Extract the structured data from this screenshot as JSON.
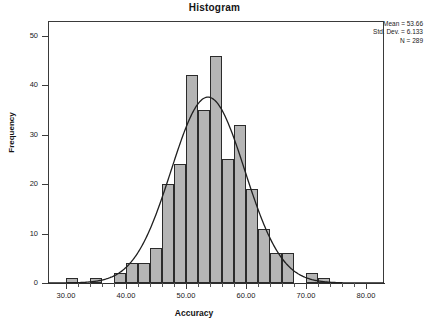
{
  "chart_data": {
    "type": "bar",
    "title": "Histogram",
    "xlabel": "Accuracy",
    "ylabel": "Frequency",
    "xlim": [
      27,
      83
    ],
    "ylim": [
      0,
      53
    ],
    "grid": false,
    "legend": "none",
    "bin_width": 2,
    "bin_starts": [
      30,
      32,
      34,
      36,
      38,
      40,
      42,
      44,
      46,
      48,
      50,
      52,
      54,
      56,
      58,
      60,
      62,
      64,
      66,
      68,
      70,
      72
    ],
    "categories": [
      "30-32",
      "32-34",
      "34-36",
      "36-38",
      "38-40",
      "40-42",
      "42-44",
      "44-46",
      "46-48",
      "48-50",
      "50-52",
      "52-54",
      "54-56",
      "56-58",
      "58-60",
      "60-62",
      "62-64",
      "64-66",
      "66-68",
      "68-70",
      "70-72",
      "72-74"
    ],
    "values": [
      1,
      0,
      1,
      0,
      2,
      4,
      4,
      7,
      20,
      24,
      42,
      35,
      46,
      25,
      32,
      19,
      11,
      6,
      6,
      0,
      2,
      1
    ],
    "xticks": [
      30,
      40,
      50,
      60,
      70,
      80
    ],
    "xtick_labels": [
      "30.00",
      "40.00",
      "50.00",
      "60.00",
      "70.00",
      "80.00"
    ],
    "yticks": [
      0,
      10,
      20,
      30,
      40,
      50
    ],
    "ytick_labels": [
      "0",
      "10",
      "20",
      "30",
      "40",
      "50"
    ],
    "overlay": {
      "type": "normal-curve",
      "mean": 53.66,
      "std_dev": 6.133,
      "n": 289,
      "color": "#1f1f1f"
    },
    "bar_fill": "#b5b5b5",
    "bar_stroke": "#2b2b2b"
  },
  "stats": {
    "mean_line": "Mean = 53.66",
    "stddev_line": "Std. Dev. = 6.133",
    "n_line": "N = 289"
  }
}
